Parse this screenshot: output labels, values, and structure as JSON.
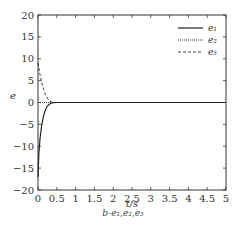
{
  "chart_data": {
    "type": "line",
    "title": "",
    "xlabel": "t/s",
    "ylabel": "e",
    "xlim": [
      0,
      5
    ],
    "ylim": [
      -20,
      20
    ],
    "xticks": [
      "0",
      "0.5",
      "1",
      "1.5",
      "2",
      "2.5",
      "3",
      "3.5",
      "4",
      "4.5",
      "5"
    ],
    "yticks": [
      "20",
      "15",
      "10",
      "5",
      "0",
      "−5",
      "−10",
      "−15",
      "−20"
    ],
    "grid": false,
    "legend_position": "upper right",
    "series": [
      {
        "name": "e1",
        "style": "solid",
        "x": [
          0,
          0.02,
          0.05,
          0.1,
          0.15,
          0.2,
          0.25,
          0.3,
          0.35,
          0.4,
          0.5,
          1,
          2,
          3,
          4,
          5
        ],
        "y": [
          -17,
          -12,
          -8.5,
          -5,
          -3,
          -1.6,
          -0.8,
          -0.4,
          -0.15,
          -0.05,
          0,
          0,
          0,
          0,
          0,
          0
        ]
      },
      {
        "name": "e2",
        "style": "dotted",
        "x": [
          0,
          0.05,
          0.1,
          0.2,
          0.3,
          0.4,
          0.5,
          1,
          2,
          3,
          4,
          5
        ],
        "y": [
          0,
          0,
          0,
          0,
          0,
          0,
          0,
          0,
          0,
          0,
          0,
          0
        ]
      },
      {
        "name": "e3",
        "style": "dashed",
        "x": [
          0,
          0.02,
          0.05,
          0.1,
          0.15,
          0.2,
          0.25,
          0.3,
          0.35,
          0.4,
          0.5,
          1,
          2,
          3,
          4,
          5
        ],
        "y": [
          9,
          8,
          6.5,
          4.5,
          3,
          1.8,
          1,
          0.4,
          0.15,
          0.05,
          0,
          0,
          0,
          0,
          0,
          0
        ]
      }
    ],
    "caption": "b-e1,e2,e3"
  },
  "labels": {
    "xlabel": "t/s",
    "ylabel": "e",
    "legend": [
      "e₁",
      "e₂",
      "e₃"
    ],
    "caption": "b-e₁,e₂,e₃"
  }
}
